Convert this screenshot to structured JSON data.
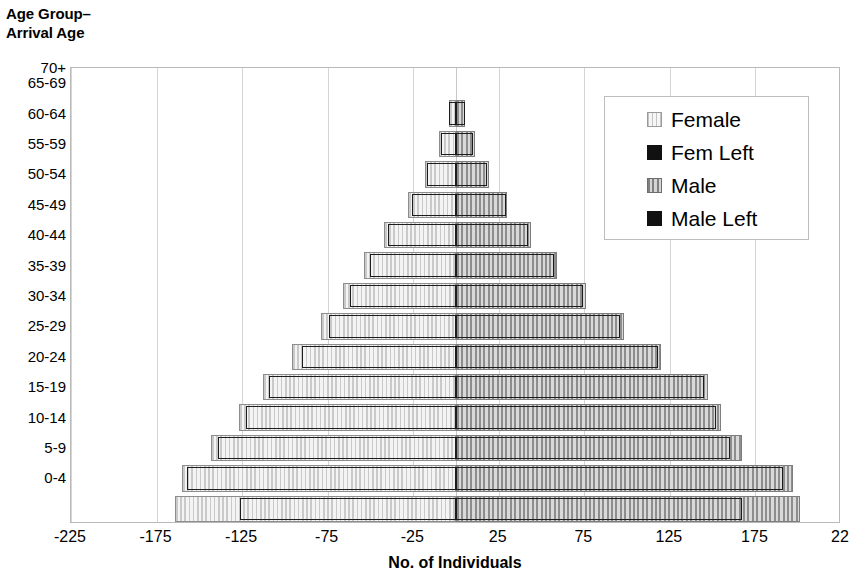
{
  "axes": {
    "y_title": "Age Group–\nArrival Age",
    "x_title": "No. of Individuals",
    "x_ticks": [
      "-225",
      "-175",
      "-125",
      "-75",
      "-25",
      "25",
      "75",
      "125",
      "175",
      "22"
    ],
    "y_ticks": [
      "70+",
      "65-69",
      "60-64",
      "55-59",
      "50-54",
      "45-49",
      "40-44",
      "35-39",
      "30-34",
      "25-29",
      "20-24",
      "15-19",
      "10-14",
      "5-9",
      "0-4"
    ]
  },
  "legend": {
    "items": [
      {
        "label": "Female",
        "swatch": "female-swatch",
        "color": "#ececec"
      },
      {
        "label": "Fem Left",
        "swatch": "fem-left-swatch",
        "color": "#111111"
      },
      {
        "label": "Male",
        "swatch": "male-swatch",
        "color": "#b0b0b0"
      },
      {
        "label": "Male Left",
        "swatch": "male-left-swatch",
        "color": "#111111"
      }
    ]
  },
  "chart_data": {
    "type": "bar",
    "subtype": "population-pyramid",
    "title": "",
    "xlabel": "No. of Individuals",
    "ylabel": "Age Group–Arrival Age",
    "xlim": [
      -225,
      225
    ],
    "xticks": [
      -225,
      -175,
      -125,
      -75,
      -25,
      25,
      75,
      125,
      175,
      225
    ],
    "grid": true,
    "legend_position": "top-right",
    "categories": [
      "0-4",
      "5-9",
      "10-14",
      "15-19",
      "20-24",
      "25-29",
      "30-34",
      "35-39",
      "40-44",
      "45-49",
      "50-54",
      "55-59",
      "60-64",
      "65-69",
      "70+"
    ],
    "note": "Female and Male are plotted left and right of zero respectively as positive magnitudes; Fem Left / Male Left are sub-counts drawn as outlined bars nested within them.",
    "series": [
      {
        "name": "Female",
        "side": "left",
        "values": [
          126,
          157,
          139,
          123,
          109,
          90,
          74,
          62,
          50,
          40,
          26,
          17,
          9,
          4,
          0
        ]
      },
      {
        "name": "Fem Left",
        "side": "left",
        "values": [
          164,
          160,
          143,
          127,
          113,
          96,
          79,
          66,
          54,
          42,
          28,
          18,
          10,
          4,
          0
        ]
      },
      {
        "name": "Male",
        "side": "right",
        "values": [
          167,
          191,
          160,
          152,
          145,
          118,
          96,
          74,
          57,
          42,
          29,
          18,
          10,
          5,
          0
        ]
      },
      {
        "name": "Male Left",
        "side": "right",
        "values": [
          201,
          197,
          167,
          155,
          147,
          120,
          98,
          76,
          59,
          44,
          30,
          19,
          11,
          5,
          0
        ]
      }
    ]
  }
}
